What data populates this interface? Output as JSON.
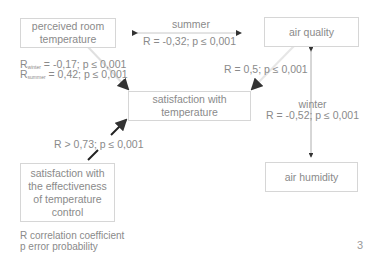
{
  "nodes": {
    "perceived_temp": "perceived room temperature",
    "air_quality": "air quality",
    "satisfaction_temp": "satisfaction with temperature",
    "satisfaction_control": "satisfaction with the effectiveness of temperature control",
    "air_humidity": "air humidity"
  },
  "edges": {
    "summer_label": "summer",
    "summer_stat": "R = -0,32; p ≤ 0,001",
    "winter_r_prefix": "R",
    "winter_r_sub": "winter",
    "winter_r_value": " = -0,17; p ≤ 0,001",
    "summer_r_prefix": "R",
    "summer_r_sub": "summer",
    "summer_r_value": " = 0,42; p ≤ 0,001",
    "air_quality_satisfaction": "R = 0,5; p ≤ 0,001",
    "winter_label": "winter",
    "winter_stat": "R = -0,52; p ≤ 0,001",
    "control_stat": "R > 0,73; p ≤ 0,001"
  },
  "legend": {
    "r": "R  correlation coefficient",
    "p": "p  error probability"
  },
  "page_number": "3"
}
